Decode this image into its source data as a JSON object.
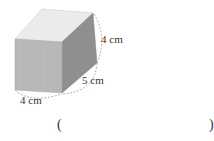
{
  "figure": {
    "shape": "rectangular-prism",
    "colors": {
      "top_face": "#e9e9e9",
      "front_face": "#b5b5b5",
      "right_face": "#8e8e8e",
      "edge": "#cfcfcf",
      "dimension_line": "#9a9a9a"
    },
    "dimensions": {
      "height": "4 cm",
      "depth": "5 cm",
      "width": "4 cm"
    }
  },
  "answer": {
    "open_paren": "(",
    "close_paren": ")"
  }
}
